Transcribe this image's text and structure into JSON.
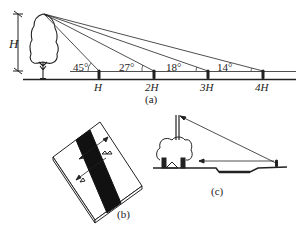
{
  "panel_a": {
    "caption": "(a)",
    "height_label": "H",
    "angles": [
      "45°",
      "27°",
      "18°",
      "14°"
    ],
    "distance_labels": [
      "H",
      "2H",
      "3H",
      "4H"
    ]
  },
  "panel_b": {
    "caption": "(b)"
  },
  "panel_c": {
    "caption": "(c)"
  },
  "colors": {
    "ink": "#222222",
    "background": "#ffffff"
  }
}
